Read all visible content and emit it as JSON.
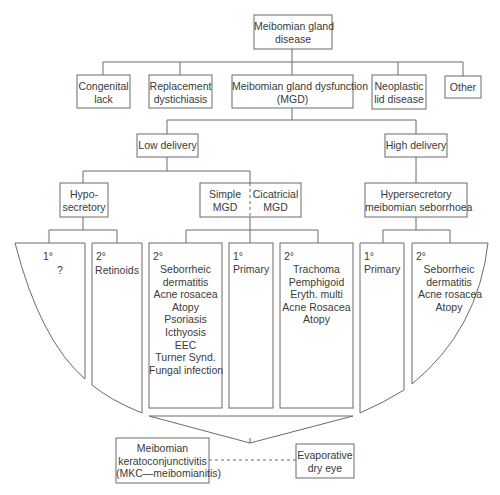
{
  "root": {
    "lines": [
      "Meibomian gland",
      "disease"
    ]
  },
  "level1": [
    {
      "id": "congenital",
      "lines": [
        "Congenital",
        "lack"
      ]
    },
    {
      "id": "replacement",
      "lines": [
        "Replacement",
        "dystichiasis"
      ]
    },
    {
      "id": "mgd",
      "lines": [
        "Meibomian gland dysfunction",
        "(MGD)"
      ]
    },
    {
      "id": "neoplastic",
      "lines": [
        "Neoplastic",
        "lid disease"
      ]
    },
    {
      "id": "other",
      "lines": [
        "Other"
      ]
    }
  ],
  "delivery": {
    "low": "Low delivery",
    "high": "High delivery"
  },
  "level3": {
    "hyposecretory": [
      "Hypo-",
      "secretory"
    ],
    "simple": [
      "Simple",
      "MGD"
    ],
    "cicatricial": [
      "Cicatricial",
      "MGD"
    ],
    "hypersecretory": [
      "Hypersecretory",
      "meibomian seborrhoea"
    ]
  },
  "leaves": {
    "hypo_primary": {
      "grade": "1°",
      "items": [
        "?"
      ]
    },
    "hypo_secondary": {
      "grade": "2°",
      "items": [
        "Retinoids"
      ]
    },
    "simple_secondary": {
      "grade": "2°",
      "items": [
        "Seborrheic",
        "dermatitis",
        "Acne rosacea",
        "Atopy",
        "Psoriasis",
        "Icthyosis",
        "EEC",
        "Turner Synd.",
        "Fungal infection"
      ]
    },
    "simple_primary": {
      "grade": "1°",
      "items": [
        "Primary"
      ]
    },
    "cicatricial_secondary": {
      "grade": "2°",
      "items": [
        "Trachoma",
        "Pemphigoid",
        "Eryth. multi",
        "Acne Rosacea",
        "Atopy"
      ]
    },
    "hyper_primary": {
      "grade": "1°",
      "items": [
        "Primary"
      ]
    },
    "hyper_secondary": {
      "grade": "2°",
      "items": [
        "Seborrheic",
        "dermatitis",
        "Acne rosacea",
        "Atopy"
      ]
    }
  },
  "outcomes": {
    "mkc": [
      "Meibomian",
      "keratoconjunctivitis",
      "(MKC—meibomianitis)"
    ],
    "dry_eye": [
      "Evaporative",
      "dry eye"
    ]
  }
}
